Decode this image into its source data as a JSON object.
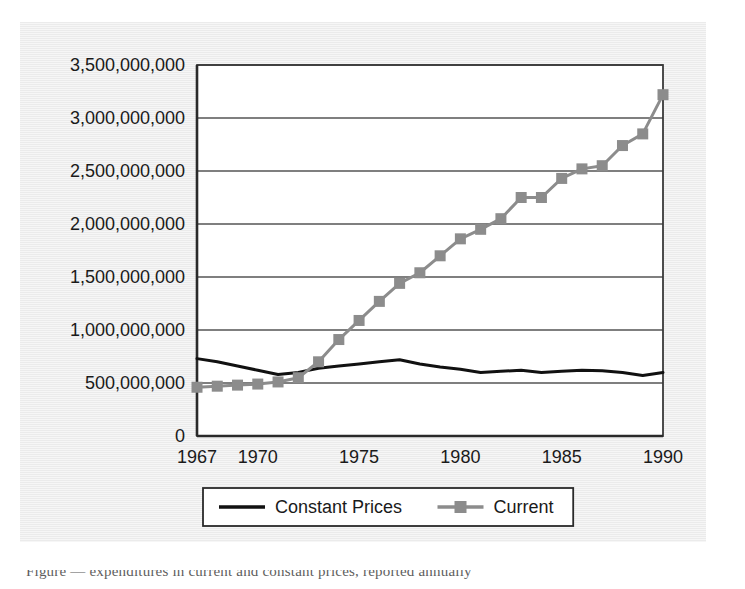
{
  "figure": {
    "background_color": "#ebebeb",
    "plot_background_color": "#ffffff",
    "border_color": "#4a4a4a"
  },
  "caption": {
    "text_fragment": "Figure  —  expenditures in current and constant prices, reported annually"
  },
  "chart_data": {
    "type": "line",
    "title": "",
    "subtitle": "",
    "xlabel": "",
    "ylabel": "",
    "grid": true,
    "legend_position": "bottom",
    "x": [
      1967,
      1968,
      1969,
      1970,
      1971,
      1972,
      1973,
      1974,
      1975,
      1976,
      1977,
      1978,
      1979,
      1980,
      1981,
      1982,
      1983,
      1984,
      1985,
      1986,
      1987,
      1988,
      1989,
      1990
    ],
    "xlim": [
      1967,
      1990
    ],
    "ylim": [
      0,
      3500000000
    ],
    "ytick_values": [
      0,
      500000000,
      1000000000,
      1500000000,
      2000000000,
      2500000000,
      3000000000,
      3500000000
    ],
    "ytick_labels": [
      "0",
      "500,000,000",
      "1,000,000,000",
      "1,500,000,000",
      "2,000,000,000",
      "2,500,000,000",
      "3,000,000,000",
      "3,500,000,000"
    ],
    "xtick_values": [
      1967,
      1970,
      1975,
      1980,
      1985,
      1990
    ],
    "xtick_labels": [
      "1967",
      "1970",
      "1975",
      "1980",
      "1985",
      "1990"
    ],
    "series": [
      {
        "name": "Constant Prices",
        "color": "#111111",
        "marker": "none",
        "line_width": 3,
        "values": [
          730000000,
          700000000,
          660000000,
          620000000,
          580000000,
          600000000,
          640000000,
          660000000,
          680000000,
          700000000,
          720000000,
          680000000,
          650000000,
          630000000,
          600000000,
          610000000,
          620000000,
          600000000,
          610000000,
          620000000,
          615000000,
          600000000,
          570000000,
          600000000
        ]
      },
      {
        "name": "Current",
        "color": "#8c8c8c",
        "marker": "square",
        "line_width": 3,
        "values": [
          460000000,
          470000000,
          480000000,
          490000000,
          510000000,
          550000000,
          700000000,
          910000000,
          1090000000,
          1270000000,
          1440000000,
          1540000000,
          1700000000,
          1860000000,
          1950000000,
          2050000000,
          2250000000,
          2250000000,
          2430000000,
          2520000000,
          2550000000,
          2740000000,
          2850000000,
          3220000000
        ]
      }
    ]
  },
  "legend": {
    "items": [
      {
        "label": "Constant Prices",
        "color": "#111111",
        "marker": "none"
      },
      {
        "label": "Current",
        "color": "#8c8c8c",
        "marker": "square"
      }
    ]
  }
}
